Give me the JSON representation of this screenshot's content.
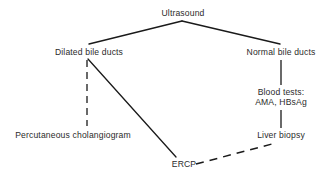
{
  "diagram": {
    "canvas": {
      "width": 329,
      "height": 179,
      "background": "#ffffff"
    },
    "stroke_color": "#1a1a1a",
    "text_color": "#2b2b2b",
    "nodes": [
      {
        "id": "ultrasound",
        "label": "Ultrasound",
        "x": 183,
        "y": 13
      },
      {
        "id": "dilated-bile-ducts",
        "label": "Dilated bile ducts",
        "x": 89,
        "y": 52
      },
      {
        "id": "normal-bile-ducts",
        "label": "Normal bile ducts",
        "x": 281,
        "y": 52
      },
      {
        "id": "blood-tests",
        "label": "Blood tests:",
        "label2": "AMA, HBsAg",
        "x": 281,
        "y": 97
      },
      {
        "id": "percutaneous-cholangiogram",
        "label": "Percutaneous cholangiogram",
        "x": 73,
        "y": 135
      },
      {
        "id": "liver-biopsy",
        "label": "Liver biopsy",
        "x": 281,
        "y": 135
      },
      {
        "id": "ercp",
        "label": "ERCP",
        "x": 184,
        "y": 164
      }
    ],
    "edges": [
      {
        "id": "ultrasound-to-dilated",
        "from": "ultrasound",
        "to": "dilated-bile-ducts",
        "style": "solid",
        "x1": 182,
        "y1": 21,
        "x2": 89,
        "y2": 44
      },
      {
        "id": "ultrasound-to-normal",
        "from": "ultrasound",
        "to": "normal-bile-ducts",
        "style": "solid",
        "x1": 182,
        "y1": 21,
        "x2": 280,
        "y2": 44
      },
      {
        "id": "dilated-to-percutaneous",
        "from": "dilated-bile-ducts",
        "to": "percutaneous-cholangiogram",
        "style": "dashed",
        "x1": 87,
        "y1": 60,
        "x2": 87,
        "y2": 126
      },
      {
        "id": "dilated-to-ercp",
        "from": "dilated-bile-ducts",
        "to": "ercp",
        "style": "solid",
        "x1": 88,
        "y1": 59,
        "x2": 176,
        "y2": 157
      },
      {
        "id": "normal-to-blood-tests",
        "from": "normal-bile-ducts",
        "to": "blood-tests",
        "style": "solid",
        "x1": 281,
        "y1": 60,
        "x2": 281,
        "y2": 85
      },
      {
        "id": "blood-tests-to-liver-biopsy",
        "from": "blood-tests",
        "to": "liver-biopsy",
        "style": "solid",
        "x1": 281,
        "y1": 110,
        "x2": 281,
        "y2": 128
      },
      {
        "id": "ercp-to-liver-biopsy",
        "from": "ercp",
        "to": "liver-biopsy",
        "style": "dashed",
        "x1": 196,
        "y1": 164,
        "x2": 272,
        "y2": 144
      }
    ]
  }
}
